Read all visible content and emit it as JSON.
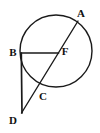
{
  "figure": {
    "background_color": "#ffffff",
    "stroke_color": "#1a1a1a",
    "width": 100,
    "height": 133
  },
  "circle": {
    "name": "circle",
    "center_x": 56,
    "center_y": 51,
    "radius": 36,
    "stroke_width": 1.4
  },
  "labels": {
    "a": "A",
    "b": "B",
    "c": "C",
    "d": "D",
    "f": "F"
  },
  "points": {
    "A": {
      "x": 77,
      "y": 22,
      "label_x": 81,
      "label_y": 13
    },
    "B": {
      "x": 21,
      "y": 53,
      "label_x": 13,
      "label_y": 53
    },
    "C": {
      "x": 38,
      "y": 88,
      "label_x": 43,
      "label_y": 97
    },
    "D": {
      "x": 22,
      "y": 113,
      "label_x": 13,
      "label_y": 120
    },
    "F": {
      "x": 58,
      "y": 53,
      "label_x": 65,
      "label_y": 52
    }
  },
  "segments": [
    {
      "name": "segment-BF",
      "from": "B",
      "to": "F",
      "stroke_width": 1.6
    },
    {
      "name": "segment-BD",
      "from": "B",
      "to": "D",
      "stroke_width": 1.6
    },
    {
      "name": "segment-AD",
      "from": "A",
      "to": "D",
      "stroke_width": 1.4
    }
  ],
  "paths": {
    "circle_path": "M 56 15 A 36 36 0 1 1 55.99 15 Z",
    "bf_path": "M 21 53 L 58 53",
    "bd_path": "M 21.5 53 L 22 113",
    "ad_path": "M 77.5 21.5 L 21.5 113"
  }
}
